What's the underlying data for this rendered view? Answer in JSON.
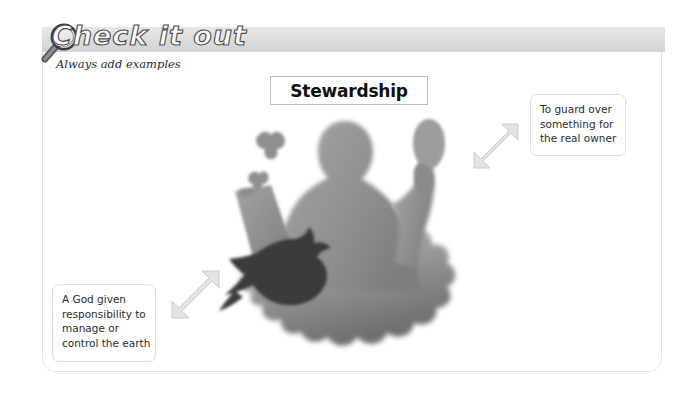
{
  "header": {
    "title": "Check it out",
    "subtitle": "Always add examples",
    "icon": "magnifying-glass-icon",
    "bar_color": "#dcdcdc"
  },
  "main": {
    "title_box": {
      "label": "Stewardship"
    },
    "artwork": {
      "name": "stewardship-silhouette-illustration",
      "description": "Blurred grayscale silhouette of a person holding a clipboard and plant, with a bird, butterflies and foliage",
      "elements": [
        "person-silhouette",
        "clipboard",
        "plant",
        "bird-silhouette",
        "butterfly",
        "butterfly",
        "foliage"
      ]
    },
    "callouts": [
      {
        "id": "callout-right",
        "lines": [
          "To guard over",
          "something for",
          "the real owner"
        ],
        "arrow": "double-headed-diagonal-arrow"
      },
      {
        "id": "callout-left",
        "lines": [
          "A God given",
          "responsibility to",
          "manage or",
          "control the earth"
        ],
        "arrow": "double-headed-diagonal-arrow"
      }
    ]
  },
  "colors": {
    "page_background": "#ffffff",
    "frame_border": "#e2e2e2",
    "header_gradient_top": "#e7e7e7",
    "header_gradient_bottom": "#d2d2d2",
    "callout_border": "#dedede",
    "text": "#2d2d2d",
    "title_text": "#111111",
    "arrow_fill": "#e3e3e3",
    "arrow_stroke": "#c9c9c9"
  }
}
